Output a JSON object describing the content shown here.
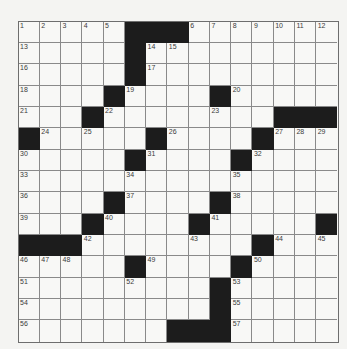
{
  "puzzle": {
    "rows": 15,
    "cols": 15,
    "colors": {
      "background": "#f4f4f2",
      "cell": "#f8f8f6",
      "black": "#1c1c1c",
      "gridline": "#8a8a8a",
      "number": "#3a3a3a"
    },
    "blacks": [
      [
        0,
        5
      ],
      [
        0,
        6
      ],
      [
        0,
        7
      ],
      [
        1,
        5
      ],
      [
        2,
        5
      ],
      [
        3,
        4
      ],
      [
        3,
        9
      ],
      [
        4,
        3
      ],
      [
        4,
        12
      ],
      [
        4,
        13
      ],
      [
        4,
        14
      ],
      [
        5,
        0
      ],
      [
        5,
        6
      ],
      [
        5,
        11
      ],
      [
        6,
        5
      ],
      [
        6,
        10
      ],
      [
        8,
        4
      ],
      [
        8,
        9
      ],
      [
        9,
        3
      ],
      [
        9,
        8
      ],
      [
        9,
        14
      ],
      [
        10,
        0
      ],
      [
        10,
        1
      ],
      [
        10,
        2
      ],
      [
        10,
        11
      ],
      [
        11,
        5
      ],
      [
        11,
        10
      ],
      [
        12,
        9
      ],
      [
        13,
        9
      ],
      [
        14,
        7
      ],
      [
        14,
        8
      ],
      [
        14,
        9
      ]
    ],
    "numbers": [
      {
        "r": 0,
        "c": 0,
        "n": "1"
      },
      {
        "r": 0,
        "c": 1,
        "n": "2"
      },
      {
        "r": 0,
        "c": 2,
        "n": "3"
      },
      {
        "r": 0,
        "c": 3,
        "n": "4"
      },
      {
        "r": 0,
        "c": 4,
        "n": "5"
      },
      {
        "r": 0,
        "c": 8,
        "n": "6"
      },
      {
        "r": 0,
        "c": 9,
        "n": "7"
      },
      {
        "r": 0,
        "c": 10,
        "n": "8"
      },
      {
        "r": 0,
        "c": 11,
        "n": "9"
      },
      {
        "r": 0,
        "c": 12,
        "n": "10"
      },
      {
        "r": 0,
        "c": 13,
        "n": "11"
      },
      {
        "r": 0,
        "c": 14,
        "n": "12"
      },
      {
        "r": 1,
        "c": 0,
        "n": "13"
      },
      {
        "r": 1,
        "c": 6,
        "n": "14"
      },
      {
        "r": 1,
        "c": 7,
        "n": "15"
      },
      {
        "r": 2,
        "c": 0,
        "n": "16"
      },
      {
        "r": 2,
        "c": 6,
        "n": "17"
      },
      {
        "r": 3,
        "c": 0,
        "n": "18"
      },
      {
        "r": 3,
        "c": 5,
        "n": "19"
      },
      {
        "r": 3,
        "c": 10,
        "n": "20"
      },
      {
        "r": 4,
        "c": 0,
        "n": "21"
      },
      {
        "r": 4,
        "c": 4,
        "n": "22"
      },
      {
        "r": 4,
        "c": 9,
        "n": "23"
      },
      {
        "r": 5,
        "c": 1,
        "n": "24"
      },
      {
        "r": 5,
        "c": 3,
        "n": "25"
      },
      {
        "r": 5,
        "c": 7,
        "n": "26"
      },
      {
        "r": 5,
        "c": 12,
        "n": "27"
      },
      {
        "r": 5,
        "c": 13,
        "n": "28"
      },
      {
        "r": 5,
        "c": 14,
        "n": "29"
      },
      {
        "r": 6,
        "c": 0,
        "n": "30"
      },
      {
        "r": 6,
        "c": 6,
        "n": "31"
      },
      {
        "r": 6,
        "c": 11,
        "n": "32"
      },
      {
        "r": 7,
        "c": 0,
        "n": "33"
      },
      {
        "r": 7,
        "c": 5,
        "n": "34"
      },
      {
        "r": 7,
        "c": 10,
        "n": "35"
      },
      {
        "r": 8,
        "c": 0,
        "n": "36"
      },
      {
        "r": 8,
        "c": 5,
        "n": "37"
      },
      {
        "r": 8,
        "c": 10,
        "n": "38"
      },
      {
        "r": 9,
        "c": 0,
        "n": "39"
      },
      {
        "r": 9,
        "c": 4,
        "n": "40"
      },
      {
        "r": 9,
        "c": 9,
        "n": "41"
      },
      {
        "r": 10,
        "c": 3,
        "n": "42"
      },
      {
        "r": 10,
        "c": 8,
        "n": "43"
      },
      {
        "r": 10,
        "c": 12,
        "n": "44"
      },
      {
        "r": 10,
        "c": 14,
        "n": "45"
      },
      {
        "r": 11,
        "c": 0,
        "n": "46"
      },
      {
        "r": 11,
        "c": 1,
        "n": "47"
      },
      {
        "r": 11,
        "c": 2,
        "n": "48"
      },
      {
        "r": 11,
        "c": 6,
        "n": "49"
      },
      {
        "r": 11,
        "c": 11,
        "n": "50"
      },
      {
        "r": 12,
        "c": 0,
        "n": "51"
      },
      {
        "r": 12,
        "c": 5,
        "n": "52"
      },
      {
        "r": 12,
        "c": 10,
        "n": "53"
      },
      {
        "r": 13,
        "c": 0,
        "n": "54"
      },
      {
        "r": 13,
        "c": 10,
        "n": "55"
      },
      {
        "r": 14,
        "c": 0,
        "n": "56"
      },
      {
        "r": 14,
        "c": 10,
        "n": "57"
      }
    ]
  }
}
